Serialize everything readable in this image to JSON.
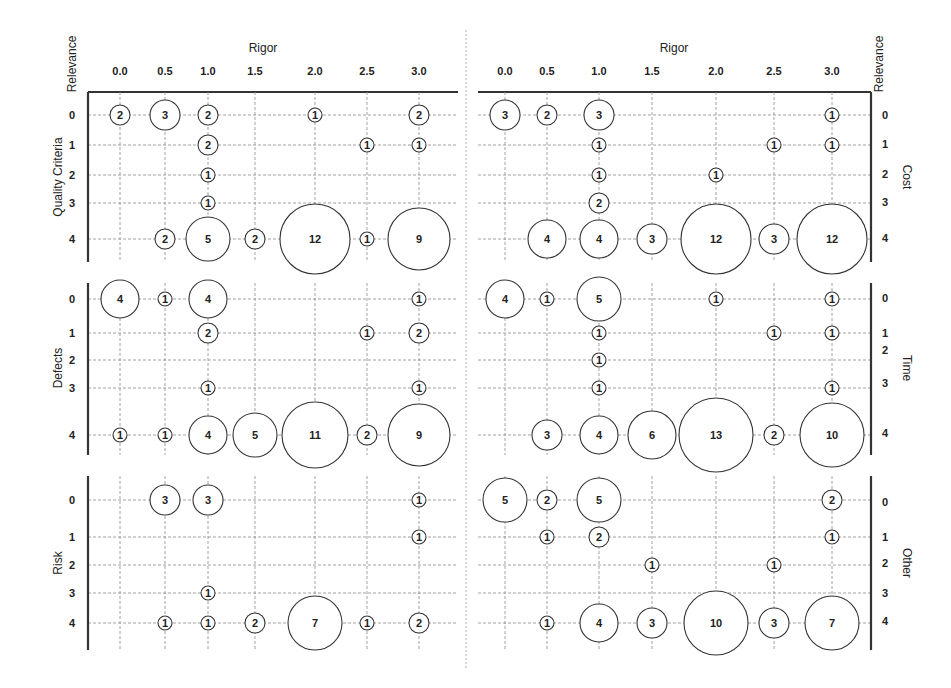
{
  "chart_data": {
    "type": "bubble-matrix",
    "title": "",
    "x_axis_label": "Rigor",
    "y_axis_label": "Relevance",
    "x_ticks": [
      "0.0",
      "0.5",
      "1.0",
      "1.5",
      "2.0",
      "2.5",
      "3.0"
    ],
    "y_ticks": [
      "0",
      "1",
      "2",
      "3",
      "4"
    ],
    "grid": true,
    "panels": [
      {
        "name": "Quality Criteria",
        "side": "left",
        "points": [
          {
            "rigor": 0.0,
            "relevance": 0,
            "count": 2
          },
          {
            "rigor": 0.5,
            "relevance": 0,
            "count": 3
          },
          {
            "rigor": 1.0,
            "relevance": 0,
            "count": 2
          },
          {
            "rigor": 2.0,
            "relevance": 0,
            "count": 1
          },
          {
            "rigor": 3.0,
            "relevance": 0,
            "count": 2
          },
          {
            "rigor": 1.0,
            "relevance": 1,
            "count": 2
          },
          {
            "rigor": 2.5,
            "relevance": 1,
            "count": 1
          },
          {
            "rigor": 3.0,
            "relevance": 1,
            "count": 1
          },
          {
            "rigor": 1.0,
            "relevance": 2,
            "count": 1
          },
          {
            "rigor": 1.0,
            "relevance": 3,
            "count": 1
          },
          {
            "rigor": 0.5,
            "relevance": 4,
            "count": 2
          },
          {
            "rigor": 1.0,
            "relevance": 4,
            "count": 5
          },
          {
            "rigor": 1.5,
            "relevance": 4,
            "count": 2
          },
          {
            "rigor": 2.0,
            "relevance": 4,
            "count": 12
          },
          {
            "rigor": 2.5,
            "relevance": 4,
            "count": 1
          },
          {
            "rigor": 3.0,
            "relevance": 4,
            "count": 9
          }
        ]
      },
      {
        "name": "Defects",
        "side": "left",
        "points": [
          {
            "rigor": 0.0,
            "relevance": 0,
            "count": 4
          },
          {
            "rigor": 0.5,
            "relevance": 0,
            "count": 1
          },
          {
            "rigor": 1.0,
            "relevance": 0,
            "count": 4
          },
          {
            "rigor": 3.0,
            "relevance": 0,
            "count": 1
          },
          {
            "rigor": 1.0,
            "relevance": 1,
            "count": 2
          },
          {
            "rigor": 2.5,
            "relevance": 1,
            "count": 1
          },
          {
            "rigor": 3.0,
            "relevance": 1,
            "count": 2
          },
          {
            "rigor": 1.0,
            "relevance": 3,
            "count": 1
          },
          {
            "rigor": 3.0,
            "relevance": 3,
            "count": 1
          },
          {
            "rigor": 0.0,
            "relevance": 4,
            "count": 1
          },
          {
            "rigor": 0.5,
            "relevance": 4,
            "count": 1
          },
          {
            "rigor": 1.0,
            "relevance": 4,
            "count": 4
          },
          {
            "rigor": 1.5,
            "relevance": 4,
            "count": 5
          },
          {
            "rigor": 2.0,
            "relevance": 4,
            "count": 11
          },
          {
            "rigor": 2.5,
            "relevance": 4,
            "count": 2
          },
          {
            "rigor": 3.0,
            "relevance": 4,
            "count": 9
          }
        ]
      },
      {
        "name": "Risk",
        "side": "left",
        "points": [
          {
            "rigor": 0.5,
            "relevance": 0,
            "count": 3
          },
          {
            "rigor": 1.0,
            "relevance": 0,
            "count": 3
          },
          {
            "rigor": 3.0,
            "relevance": 0,
            "count": 1
          },
          {
            "rigor": 3.0,
            "relevance": 1,
            "count": 1
          },
          {
            "rigor": 1.0,
            "relevance": 3,
            "count": 1
          },
          {
            "rigor": 0.5,
            "relevance": 4,
            "count": 1
          },
          {
            "rigor": 1.0,
            "relevance": 4,
            "count": 1
          },
          {
            "rigor": 1.5,
            "relevance": 4,
            "count": 2
          },
          {
            "rigor": 2.0,
            "relevance": 4,
            "count": 7
          },
          {
            "rigor": 2.5,
            "relevance": 4,
            "count": 1
          },
          {
            "rigor": 3.0,
            "relevance": 4,
            "count": 2
          }
        ]
      },
      {
        "name": "Cost",
        "side": "right",
        "points": [
          {
            "rigor": 0.0,
            "relevance": 0,
            "count": 3
          },
          {
            "rigor": 0.5,
            "relevance": 0,
            "count": 2
          },
          {
            "rigor": 1.0,
            "relevance": 0,
            "count": 3
          },
          {
            "rigor": 3.0,
            "relevance": 0,
            "count": 1
          },
          {
            "rigor": 1.0,
            "relevance": 1,
            "count": 1
          },
          {
            "rigor": 2.5,
            "relevance": 1,
            "count": 1
          },
          {
            "rigor": 3.0,
            "relevance": 1,
            "count": 1
          },
          {
            "rigor": 1.0,
            "relevance": 2,
            "count": 1
          },
          {
            "rigor": 2.0,
            "relevance": 2,
            "count": 1
          },
          {
            "rigor": 1.0,
            "relevance": 3,
            "count": 2
          },
          {
            "rigor": 0.5,
            "relevance": 4,
            "count": 4
          },
          {
            "rigor": 1.0,
            "relevance": 4,
            "count": 4
          },
          {
            "rigor": 1.5,
            "relevance": 4,
            "count": 3
          },
          {
            "rigor": 2.0,
            "relevance": 4,
            "count": 12
          },
          {
            "rigor": 2.5,
            "relevance": 4,
            "count": 3
          },
          {
            "rigor": 3.0,
            "relevance": 4,
            "count": 12
          }
        ]
      },
      {
        "name": "Time",
        "side": "right",
        "points": [
          {
            "rigor": 0.0,
            "relevance": 0,
            "count": 4
          },
          {
            "rigor": 0.5,
            "relevance": 0,
            "count": 1
          },
          {
            "rigor": 1.0,
            "relevance": 0,
            "count": 5
          },
          {
            "rigor": 2.0,
            "relevance": 0,
            "count": 1
          },
          {
            "rigor": 3.0,
            "relevance": 0,
            "count": 1
          },
          {
            "rigor": 1.0,
            "relevance": 1,
            "count": 1
          },
          {
            "rigor": 2.5,
            "relevance": 1,
            "count": 1
          },
          {
            "rigor": 3.0,
            "relevance": 1,
            "count": 1
          },
          {
            "rigor": 1.0,
            "relevance": 2,
            "count": 1
          },
          {
            "rigor": 1.0,
            "relevance": 3,
            "count": 1
          },
          {
            "rigor": 3.0,
            "relevance": 3,
            "count": 1
          },
          {
            "rigor": 0.5,
            "relevance": 4,
            "count": 3
          },
          {
            "rigor": 1.0,
            "relevance": 4,
            "count": 4
          },
          {
            "rigor": 1.5,
            "relevance": 4,
            "count": 6
          },
          {
            "rigor": 2.0,
            "relevance": 4,
            "count": 13
          },
          {
            "rigor": 2.5,
            "relevance": 4,
            "count": 2
          },
          {
            "rigor": 3.0,
            "relevance": 4,
            "count": 10
          }
        ]
      },
      {
        "name": "Other",
        "side": "right",
        "points": [
          {
            "rigor": 0.0,
            "relevance": 0,
            "count": 5
          },
          {
            "rigor": 0.5,
            "relevance": 0,
            "count": 2
          },
          {
            "rigor": 1.0,
            "relevance": 0,
            "count": 5
          },
          {
            "rigor": 3.0,
            "relevance": 0,
            "count": 2
          },
          {
            "rigor": 0.5,
            "relevance": 1,
            "count": 1
          },
          {
            "rigor": 1.0,
            "relevance": 1,
            "count": 2
          },
          {
            "rigor": 3.0,
            "relevance": 1,
            "count": 1
          },
          {
            "rigor": 1.5,
            "relevance": 2,
            "count": 1
          },
          {
            "rigor": 2.5,
            "relevance": 2,
            "count": 1
          },
          {
            "rigor": 0.5,
            "relevance": 4,
            "count": 1
          },
          {
            "rigor": 1.0,
            "relevance": 4,
            "count": 4
          },
          {
            "rigor": 1.5,
            "relevance": 4,
            "count": 3
          },
          {
            "rigor": 2.0,
            "relevance": 4,
            "count": 10
          },
          {
            "rigor": 2.5,
            "relevance": 4,
            "count": 3
          },
          {
            "rigor": 3.0,
            "relevance": 4,
            "count": 7
          }
        ]
      }
    ]
  },
  "layout": {
    "left_x_positions": [
      120,
      165,
      208,
      255,
      315,
      367,
      419
    ],
    "right_x_positions": [
      505,
      547,
      599,
      652,
      716,
      774,
      832
    ],
    "left_axis_x": 88,
    "left_grid_end": 458,
    "right_axis_x": 871,
    "right_grid_start": 478,
    "top_axis_y": 92,
    "row_y": [
      [
        115,
        145,
        175,
        203,
        239
      ],
      [
        299,
        333,
        360,
        388,
        435
      ],
      [
        500,
        537,
        565,
        593,
        623
      ]
    ],
    "right_label_y": [
      [
        115,
        144,
        174,
        202,
        238
      ],
      [
        298,
        333,
        350,
        383,
        433
      ],
      [
        502,
        537,
        563,
        593,
        621
      ]
    ],
    "panel_y_range": [
      [
        92,
        262
      ],
      [
        283,
        455
      ],
      [
        476,
        650
      ]
    ],
    "bubble_radius": {
      "1": 7,
      "2": 10,
      "3": 15,
      "4": 19,
      "5": 22,
      "6": 24,
      "7": 27,
      "9": 31,
      "10": 32,
      "11": 33,
      "12": 35,
      "13": 37
    }
  }
}
